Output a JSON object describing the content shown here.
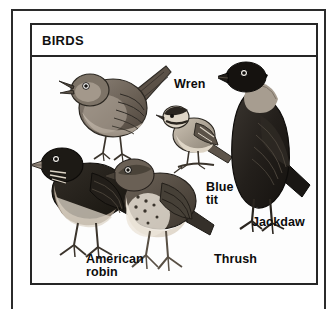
{
  "plate": {
    "title": "BIRDS",
    "background_color": "#fdfdfd",
    "border_color": "#262626",
    "ink_color": "#0c0c0c"
  },
  "labels": {
    "wren": "Wren",
    "blue_tit": "Blue\ntit",
    "jackdaw": "Jackdaw",
    "american_robin": "American\nrobin",
    "thrush": "Thrush"
  },
  "figures": [
    {
      "name": "wren",
      "label": "Wren",
      "facing": "left",
      "pose": "standing, tail cocked up, beak open"
    },
    {
      "name": "blue-tit",
      "label": "Blue tit",
      "facing": "left",
      "pose": "perched on twig"
    },
    {
      "name": "jackdaw",
      "label": "Jackdaw",
      "facing": "left",
      "pose": "standing upright, dark plumage with pale nape"
    },
    {
      "name": "american-robin",
      "label": "American robin",
      "facing": "left",
      "pose": "standing, pale breast"
    },
    {
      "name": "thrush",
      "label": "Thrush",
      "facing": "left",
      "pose": "standing, spotted breast"
    }
  ]
}
